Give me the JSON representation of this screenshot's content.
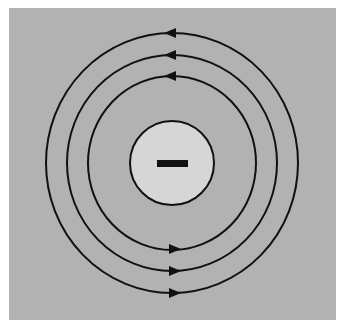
{
  "diagram": {
    "colors": {
      "page_background": "#ffffff",
      "panel_background": "#b2b2b2",
      "charge_fill": "#d6d6d6",
      "stroke": "#111111"
    },
    "charge": {
      "sign": "−",
      "type": "negative",
      "center": [
        172,
        163
      ],
      "radius": 42
    },
    "field_lines": [
      {
        "name": "inner",
        "rx": 84,
        "ry": 87,
        "top_arrow_direction": "left",
        "bottom_arrow_direction": "right"
      },
      {
        "name": "middle",
        "rx": 105,
        "ry": 108,
        "top_arrow_direction": "left",
        "bottom_arrow_direction": "right"
      },
      {
        "name": "outer",
        "rx": 126,
        "ry": 130,
        "top_arrow_direction": "left",
        "bottom_arrow_direction": "right"
      }
    ]
  }
}
